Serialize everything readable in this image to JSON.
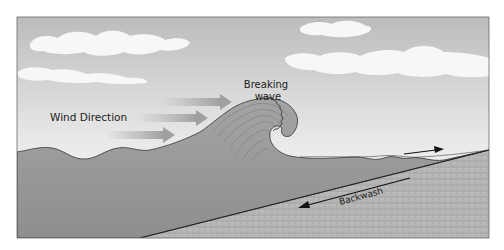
{
  "diagram": {
    "labels": {
      "wind_direction": "Wind Direction",
      "breaking_wave_line1": "Breaking",
      "breaking_wave_line2": "wave",
      "backwash": "Backwash"
    },
    "colors": {
      "sky_top": "#b9b9b9",
      "sky_bottom": "#fbfbfb",
      "cloud": "#f6f6f6",
      "water": "#9a9a9a",
      "water_dark": "#8c8c8c",
      "sand": "#b4b4b4",
      "arrow_wind": "#a8a8a8",
      "arrow_dark": "#1a1a1a",
      "frame": "#555555"
    },
    "elements": {
      "wind_arrows": 3,
      "swash_arrow": "right",
      "backwash_arrow": "left"
    }
  }
}
